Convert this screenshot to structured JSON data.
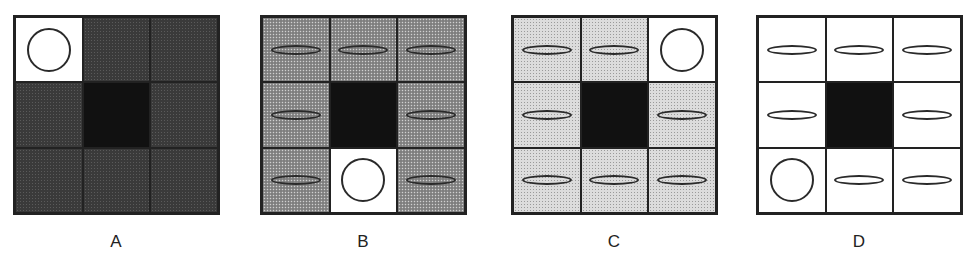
{
  "figure": {
    "panels": [
      {
        "label": "A",
        "left": 13,
        "cells": [
          {
            "fill": "white",
            "glyph": "circle"
          },
          {
            "fill": "dark",
            "glyph": "none"
          },
          {
            "fill": "dark",
            "glyph": "none"
          },
          {
            "fill": "dark",
            "glyph": "none"
          },
          {
            "fill": "black",
            "glyph": "none"
          },
          {
            "fill": "dark",
            "glyph": "none"
          },
          {
            "fill": "dark",
            "glyph": "none"
          },
          {
            "fill": "dark",
            "glyph": "none"
          },
          {
            "fill": "dark",
            "glyph": "none"
          }
        ]
      },
      {
        "label": "B",
        "left": 260,
        "cells": [
          {
            "fill": "medium",
            "glyph": "ellipse"
          },
          {
            "fill": "medium",
            "glyph": "ellipse"
          },
          {
            "fill": "medium",
            "glyph": "ellipse"
          },
          {
            "fill": "medium",
            "glyph": "ellipse"
          },
          {
            "fill": "black",
            "glyph": "none"
          },
          {
            "fill": "medium",
            "glyph": "ellipse"
          },
          {
            "fill": "medium",
            "glyph": "ellipse"
          },
          {
            "fill": "white",
            "glyph": "circle"
          },
          {
            "fill": "medium",
            "glyph": "ellipse"
          }
        ]
      },
      {
        "label": "C",
        "left": 511,
        "cells": [
          {
            "fill": "light",
            "glyph": "ellipse"
          },
          {
            "fill": "light",
            "glyph": "ellipse"
          },
          {
            "fill": "white",
            "glyph": "circle"
          },
          {
            "fill": "light",
            "glyph": "ellipse"
          },
          {
            "fill": "black",
            "glyph": "none"
          },
          {
            "fill": "light",
            "glyph": "ellipse"
          },
          {
            "fill": "light",
            "glyph": "ellipse"
          },
          {
            "fill": "light",
            "glyph": "ellipse"
          },
          {
            "fill": "light",
            "glyph": "ellipse"
          }
        ]
      },
      {
        "label": "D",
        "left": 756,
        "cells": [
          {
            "fill": "white",
            "glyph": "ellipse"
          },
          {
            "fill": "white",
            "glyph": "ellipse"
          },
          {
            "fill": "white",
            "glyph": "ellipse"
          },
          {
            "fill": "white",
            "glyph": "ellipse"
          },
          {
            "fill": "black",
            "glyph": "none"
          },
          {
            "fill": "white",
            "glyph": "ellipse"
          },
          {
            "fill": "white",
            "glyph": "circle"
          },
          {
            "fill": "white",
            "glyph": "ellipse"
          },
          {
            "fill": "white",
            "glyph": "ellipse"
          }
        ]
      }
    ],
    "colors": {
      "dark": "#3a3a3a",
      "medium": "#8c8c8c",
      "light": "#dcdcdc",
      "white": "#ffffff",
      "black": "#111111",
      "stroke": "#222222"
    }
  }
}
